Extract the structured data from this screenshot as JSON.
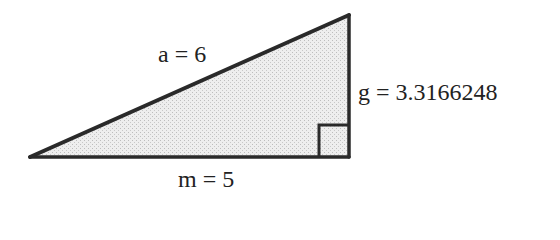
{
  "diagram": {
    "type": "right-triangle",
    "labels": {
      "hypotenuse": "a = 6",
      "base": "m = 5",
      "height": "g = 3.3166248"
    },
    "values": {
      "a": 6,
      "m": 5,
      "g": 3.3166248
    },
    "colors": {
      "stroke": "#2a2a2a",
      "fill": "#e6e6e6",
      "text": "#222222",
      "background": "#ffffff"
    },
    "right_angle_marker": true
  }
}
